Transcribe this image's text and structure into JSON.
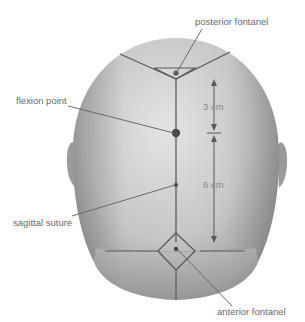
{
  "diagram": {
    "labels": {
      "posterior_fontanel": "posterior fontanel",
      "flexion_point": "flexion point",
      "sagittal_suture": "sagittal suture",
      "anterior_fontanel": "anterior fontanel"
    },
    "measurements": {
      "upper": "3 cm",
      "lower": "6 cm"
    },
    "colors": {
      "head_light": "#d8d8d8",
      "head_dark": "#8a8a8a",
      "suture_line": "#5a5a5a",
      "leader_line": "#6a6a6a",
      "label_text": "#6a6a6a",
      "background": "#ffffff"
    }
  }
}
